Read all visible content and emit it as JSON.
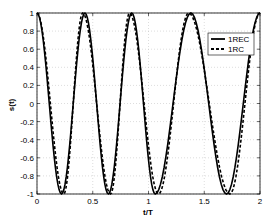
{
  "chart_data": {
    "type": "line",
    "title": "",
    "xlabel": "t/T",
    "ylabel": "s(t)",
    "xlim": [
      0,
      2
    ],
    "ylim": [
      -1,
      1
    ],
    "grid": true,
    "legend_position": "upper right",
    "xticks": [
      "0",
      "0.5",
      "1",
      "1.5",
      "2"
    ],
    "yticks": [
      "1",
      "0.8",
      "0.6",
      "0.4",
      "0.2",
      "0",
      "-0.2",
      "-0.4",
      "-0.6",
      "-0.8",
      "-1"
    ],
    "series": [
      {
        "name": "1REC",
        "style": "solid",
        "x": [
          0,
          0.22,
          0.43,
          0.64,
          0.85,
          1.06,
          1.38,
          1.7,
          2.0
        ],
        "y": [
          1,
          -1,
          1,
          -1,
          1,
          -1,
          1,
          -1,
          1
        ]
      },
      {
        "name": "1RC",
        "style": "dashed",
        "x": [
          0,
          0.24,
          0.41,
          0.66,
          0.83,
          1.09,
          1.36,
          1.73,
          2.0
        ],
        "y": [
          1,
          -1,
          1,
          -1,
          1,
          -1,
          1,
          -1,
          1
        ]
      }
    ]
  }
}
